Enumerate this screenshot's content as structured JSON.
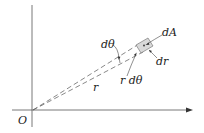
{
  "diagram": {
    "labels": {
      "origin": "O",
      "d_theta": "dθ",
      "dA": "dA",
      "dr": "dr",
      "r_dtheta": "r dθ",
      "r": "r"
    },
    "colors": {
      "line": "#444444",
      "element_fill": "#d9d9d9",
      "text": "#222222"
    }
  }
}
